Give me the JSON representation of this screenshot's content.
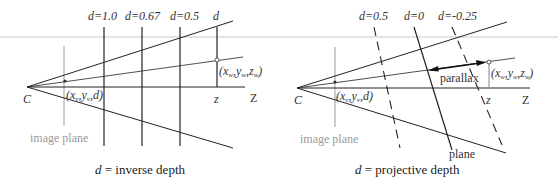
{
  "left_diagram": {
    "title_prefix": "d",
    "title_suffix": " = inverse depth",
    "camera_label": "C",
    "axis_label": "Z",
    "z_label": "z",
    "image_plane_label": "image plane",
    "image_point_label": "(xᵥ,yᵥ,d)",
    "world_point_label": "(xᵥᵥ,yᵥᵥ,zᵥᵥ)",
    "depth_lines": [
      {
        "label": "d=1.0"
      },
      {
        "label": "d=0.67"
      },
      {
        "label": "d=0.5"
      },
      {
        "label": "d"
      }
    ]
  },
  "right_diagram": {
    "title_prefix": "d",
    "title_suffix": " = projective depth",
    "camera_label": "C",
    "axis_label": "Z",
    "z_label": "z",
    "image_plane_label": "image plane",
    "plane_label": "plane",
    "parallax_label": "parallax",
    "depth_lines": [
      {
        "label": "d=0.5",
        "style": "dashed"
      },
      {
        "label": "d=0",
        "style": "solid"
      },
      {
        "label": "d=-0.25",
        "style": "dashed"
      }
    ]
  },
  "colors": {
    "line": "#222222",
    "gray": "#9a9a9a",
    "separator": "#c8c8c8"
  }
}
